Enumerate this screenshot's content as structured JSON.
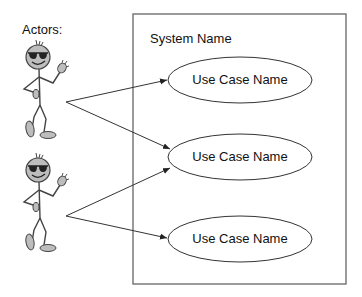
{
  "actors_label": "Actors:",
  "system": {
    "name": "System Name"
  },
  "use_cases": [
    {
      "label": "Use Case Name"
    },
    {
      "label": "Use Case Name"
    },
    {
      "label": "Use Case Name"
    }
  ],
  "actors": [
    {
      "icon": "stick-figure-sunglasses-waving"
    },
    {
      "icon": "stick-figure-sunglasses-waving"
    }
  ],
  "associations": [
    {
      "from": "actor-1",
      "to": "use-case-1"
    },
    {
      "from": "actor-1",
      "to": "use-case-2"
    },
    {
      "from": "actor-2",
      "to": "use-case-2"
    },
    {
      "from": "actor-2",
      "to": "use-case-3"
    }
  ],
  "colors": {
    "line": "#333333",
    "figure_fill": "#b8b8b8",
    "box": "#666666"
  }
}
